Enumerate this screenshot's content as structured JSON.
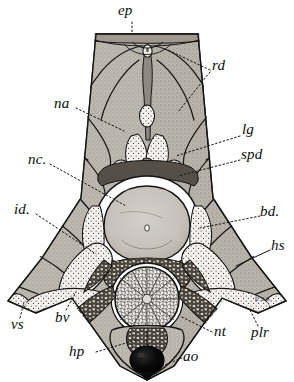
{
  "figure": {
    "kind": "anatomical-cross-section-illustration",
    "signature": "E.S.G.",
    "ink_color": "#111111",
    "muscle_fill": "#b9b4ad",
    "stipple_fill": "#f2f0ec",
    "notochord_fill": "#c9c5be",
    "dark_fill": "#3a352f",
    "aorta_fill": "#060606",
    "paper": "#ffffff"
  },
  "labels": [
    {
      "id": "ep",
      "text": "ep",
      "x": 124,
      "y": 6,
      "leader": "vertical-dotted-down"
    },
    {
      "id": "rd",
      "text": "rd",
      "x": 213,
      "y": 64,
      "leader": "dotted-left"
    },
    {
      "id": "na",
      "text": "na",
      "x": 53,
      "y": 100,
      "leader": "dotted-right"
    },
    {
      "id": "lg",
      "text": "lg",
      "x": 243,
      "y": 128,
      "leader": "dotted-left"
    },
    {
      "id": "spd",
      "text": "spd",
      "x": 243,
      "y": 152,
      "leader": "dotted-left"
    },
    {
      "id": "nc",
      "text": "nc.",
      "x": 29,
      "y": 156,
      "leader": "dotted-right"
    },
    {
      "id": "id",
      "text": "id.",
      "x": 15,
      "y": 205,
      "leader": "dotted-right"
    },
    {
      "id": "bd",
      "text": "bd.",
      "x": 262,
      "y": 208,
      "leader": "dotted-left"
    },
    {
      "id": "hs",
      "text": "hs",
      "x": 272,
      "y": 240,
      "leader": "line-left"
    },
    {
      "id": "vs",
      "text": "vs",
      "x": 12,
      "y": 320,
      "leader": "dotted-up"
    },
    {
      "id": "bv",
      "text": "bv",
      "x": 56,
      "y": 313,
      "leader": "dotted-up"
    },
    {
      "id": "hp",
      "text": "hp",
      "x": 70,
      "y": 347,
      "leader": "dotted-right"
    },
    {
      "id": "nt",
      "text": "nt",
      "x": 215,
      "y": 327,
      "leader": "dotted-left"
    },
    {
      "id": "plr",
      "text": "plr",
      "x": 252,
      "y": 328,
      "leader": "dotted-up"
    },
    {
      "id": "ao",
      "text": "ao",
      "x": 184,
      "y": 352,
      "leader": "dotted-left"
    }
  ],
  "structures": [
    {
      "id": "epaxial-ridge",
      "name": "dorsal ridge (ep)"
    },
    {
      "id": "muscle-mass-left",
      "name": "epaxial muscle mass, left"
    },
    {
      "id": "muscle-mass-right",
      "name": "epaxial muscle mass, right"
    },
    {
      "id": "neural-canal",
      "name": "neural canal / spinal cord (nc)"
    },
    {
      "id": "notochord",
      "name": "notochord (nc centrum)"
    },
    {
      "id": "spinal-ganglia",
      "name": "spinal ganglia (lg, spd)"
    },
    {
      "id": "lateral-wings",
      "name": "pleural ribs / wings (plr)"
    },
    {
      "id": "subnotochordal-rod",
      "name": "ventral cellular body (nt)"
    },
    {
      "id": "dorsal-aorta",
      "name": "dorsal aorta (ao)"
    },
    {
      "id": "haemal-process",
      "name": "haemal process (hp)"
    }
  ]
}
